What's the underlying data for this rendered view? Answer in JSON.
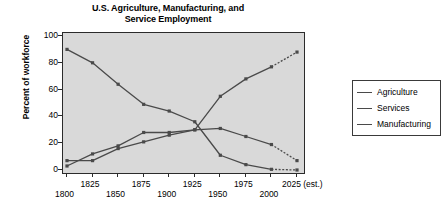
{
  "chart_data": {
    "type": "line",
    "title": "U.S. Agriculture, Manufacturing, and Service Employment",
    "title_line1": "U.S. Agriculture, Manufacturing, and",
    "title_line2": "Service Employment",
    "xlabel": "",
    "ylabel": "Percent of workforce",
    "x": [
      1800,
      1825,
      1850,
      1875,
      1900,
      1925,
      1950,
      1975,
      2000,
      2025
    ],
    "categories": [
      "1800",
      "1825",
      "1850",
      "1875",
      "1900",
      "1925",
      "1950",
      "1975",
      "2000",
      "2025 (est.)"
    ],
    "xtick_labels": [
      "1800",
      "1825",
      "1850",
      "1875",
      "1900",
      "1925",
      "1950",
      "1975",
      "2000",
      "2025 (est.)"
    ],
    "ytick_labels": [
      "0",
      "20",
      "40",
      "60",
      "80",
      "100"
    ],
    "ytick_values": [
      0,
      20,
      40,
      60,
      80,
      100
    ],
    "ylim": [
      0,
      100
    ],
    "xlim": [
      1800,
      2025
    ],
    "grid": false,
    "legend_position": "right",
    "markers": "square",
    "last_segment_style": "dashed-estimate",
    "series": [
      {
        "name": "Agriculture",
        "color": "#4a4a4a",
        "values": [
          90,
          80,
          64,
          49,
          44,
          36,
          11,
          4,
          0.5,
          0
        ]
      },
      {
        "name": "Services",
        "color": "#4a4a4a",
        "values": [
          7,
          7,
          16,
          21,
          26,
          30,
          55,
          68,
          77,
          88
        ]
      },
      {
        "name": "Manufacturing",
        "color": "#4a4a4a",
        "values": [
          3,
          12,
          18,
          28,
          28,
          30,
          31,
          25,
          19,
          7
        ]
      }
    ]
  },
  "legend": {
    "items": [
      {
        "label": "Agriculture"
      },
      {
        "label": "Services"
      },
      {
        "label": "Manufacturing"
      }
    ]
  },
  "colors": {
    "plot_background": "#d9d9d9",
    "axis": "#2b2b2b",
    "line": "#4a4a4a",
    "page_background": "#ffffff",
    "text": "#000000"
  }
}
